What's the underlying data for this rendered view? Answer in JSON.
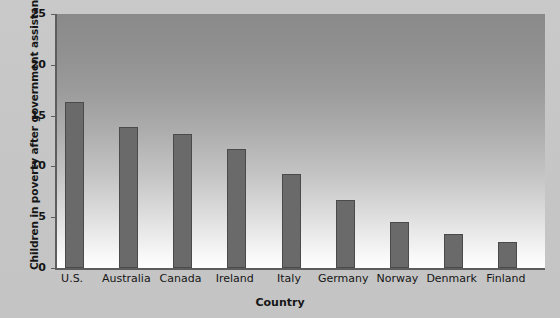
{
  "chart_data": {
    "type": "bar",
    "title": "",
    "xlabel": "Country",
    "ylabel": "Children in poverty after government assistance",
    "categories": [
      "U.S.",
      "Australia",
      "Canada",
      "Ireland",
      "Italy",
      "Germany",
      "Norway",
      "Denmark",
      "Finland"
    ],
    "values": [
      16.3,
      13.9,
      13.2,
      11.7,
      9.3,
      6.7,
      4.5,
      3.3,
      2.6
    ],
    "ylim": [
      0,
      25
    ],
    "yticks": [
      0,
      5,
      10,
      15,
      20,
      25
    ],
    "ytick_labels": [
      "0",
      "5",
      "10",
      "15",
      "20",
      "25"
    ],
    "grid": false,
    "legend": null,
    "colors": {
      "bar_fill": "#6a6a6a",
      "bar_stroke": "#4a4a4a",
      "axis": "#5d5d5d",
      "figure_background": "#c7c7c7",
      "plot_background_top": "#8a8a8a",
      "plot_background_bottom": "#ffffff",
      "text": "#161616"
    }
  }
}
